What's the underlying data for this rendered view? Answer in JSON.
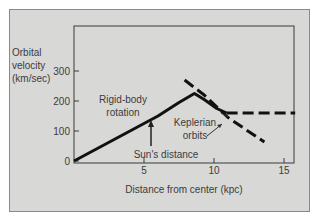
{
  "chart_data": {
    "type": "line",
    "title": "",
    "xlabel": "Distance from center (kpc)",
    "ylabel": [
      "Orbital",
      "velocity",
      "(km/sec)"
    ],
    "xlim": [
      0,
      15.8
    ],
    "ylim": [
      0,
      460
    ],
    "x_ticks": [
      5,
      10,
      15
    ],
    "y_ticks": [
      0,
      100,
      200,
      300
    ],
    "grid": false,
    "series": [
      {
        "name": "Observed rotation curve",
        "style": "solid",
        "points": [
          [
            0,
            0
          ],
          [
            2,
            50
          ],
          [
            4,
            100
          ],
          [
            6,
            150
          ],
          [
            7.5,
            195
          ],
          [
            8.6,
            225
          ],
          [
            9.3,
            205
          ],
          [
            10.2,
            175
          ],
          [
            10.9,
            160
          ]
        ]
      },
      {
        "name": "Flat extension",
        "style": "dashed",
        "points": [
          [
            10.9,
            160
          ],
          [
            15.8,
            160
          ]
        ]
      },
      {
        "name": "Keplerian orbits",
        "style": "dashed",
        "points": [
          [
            7.9,
            270
          ],
          [
            9.3,
            220
          ],
          [
            11,
            145
          ],
          [
            13.6,
            63
          ]
        ]
      }
    ],
    "annotations": [
      {
        "text": [
          "Rigid-body",
          "rotation"
        ],
        "x": 4.5,
        "y": 180
      },
      {
        "text": [
          "Keplerian",
          "orbits"
        ],
        "x": 10.0,
        "y": 110
      },
      {
        "text": [
          "Sun's distance"
        ],
        "x": 6.0,
        "y": 15
      }
    ],
    "sun_marker_x": 5.5
  }
}
